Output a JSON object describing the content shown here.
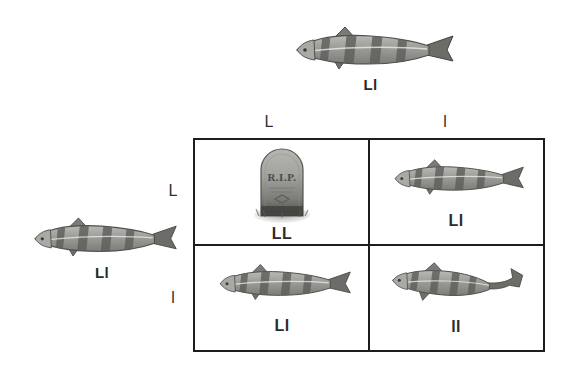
{
  "diagram": {
    "type": "punnett-square",
    "title_visible": false,
    "cross": "Ll x Ll",
    "background_color": "#ffffff",
    "line_color": "#1d1d1d",
    "text_color": "#2b2b2b"
  },
  "parents": {
    "top": {
      "genotype": "Ll",
      "organism": "fish",
      "icon": "striped-fish-icon"
    },
    "left": {
      "genotype": "Ll",
      "organism": "fish",
      "icon": "striped-fish-icon"
    }
  },
  "axes": {
    "columns": [
      "L",
      "l"
    ],
    "rows": [
      "L",
      "l"
    ]
  },
  "grid": {
    "cells": [
      {
        "id": "cell-LL",
        "genotype": "LL",
        "outcome": "lethal",
        "icon": "gravestone-icon",
        "epitaph": "R.I.P.",
        "row": "L",
        "column": "L"
      },
      {
        "id": "cell-Ll-top-right",
        "genotype": "Ll",
        "outcome": "viable",
        "icon": "striped-fish-icon",
        "row": "L",
        "column": "l"
      },
      {
        "id": "cell-Ll-bottom-left",
        "genotype": "Ll",
        "outcome": "viable",
        "icon": "striped-fish-icon",
        "row": "l",
        "column": "L"
      },
      {
        "id": "cell-ll",
        "genotype": "ll",
        "outcome": "viable",
        "icon": "striped-fish-icon",
        "row": "l",
        "column": "l"
      }
    ]
  }
}
